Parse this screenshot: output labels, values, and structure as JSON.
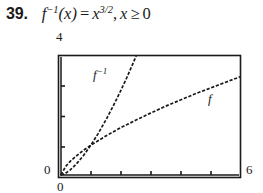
{
  "problem": {
    "number": "39.",
    "function_name": "f",
    "inverse_sup": "−1",
    "arg": "(x)",
    "equals": "=",
    "variable": "x",
    "exponent": "3/2",
    "comma": ",",
    "domain_variable": "x",
    "domain_relation": "≥",
    "domain_bound": "0",
    "full_text": "39.  f−1(x) = x3/2, x ≥ 0"
  },
  "chart_data": {
    "type": "line",
    "title": "",
    "xlabel": "",
    "ylabel": "",
    "xlim": [
      0,
      6
    ],
    "ylim": [
      0,
      4
    ],
    "grid": false,
    "legend": "inline-curve-labels",
    "x_tick_labels": [
      "0",
      "6"
    ],
    "y_tick_labels": [
      "0",
      "4"
    ],
    "x_tick_count_interior": 5,
    "y_tick_count_interior": 3,
    "line_style": "dashed",
    "line_color": "#1a1a1a",
    "intersection_point": [
      1,
      1
    ],
    "series": [
      {
        "name": "f",
        "label": "f",
        "expression": "x^(2/3)",
        "x": [
          0,
          0.15,
          0.3,
          0.5,
          0.75,
          1,
          1.5,
          2,
          2.5,
          3,
          3.5,
          4,
          4.5,
          5,
          5.5,
          6
        ],
        "values": [
          0,
          0.28,
          0.45,
          0.63,
          0.83,
          1,
          1.31,
          1.59,
          1.84,
          2.08,
          2.31,
          2.52,
          2.73,
          2.92,
          3.11,
          3.3
        ]
      },
      {
        "name": "f-inverse",
        "label": "f",
        "label_sup": "−1",
        "expression": "x^(3/2)",
        "x": [
          0,
          0.15,
          0.3,
          0.5,
          0.75,
          1,
          1.25,
          1.5,
          1.75,
          2,
          2.2,
          2.4,
          2.52
        ],
        "values": [
          0,
          0.058,
          0.164,
          0.354,
          0.65,
          1,
          1.4,
          1.84,
          2.32,
          2.83,
          3.26,
          3.72,
          4.0
        ]
      }
    ]
  },
  "labels": {
    "y_max": "4",
    "y_zero": "0",
    "x_zero": "0",
    "x_max": "6",
    "curve_f": "f",
    "curve_finv_base": "f",
    "curve_finv_sup": "−1"
  }
}
